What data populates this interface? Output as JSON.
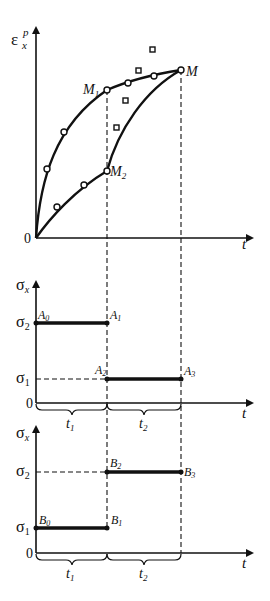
{
  "diagram": {
    "top_chart": {
      "y_axis_label": "ε",
      "y_axis_sup": "p",
      "y_axis_sub": "x",
      "x_axis_label": "t",
      "origin_label": "0",
      "points": {
        "M1": {
          "label": "M",
          "sub": "1"
        },
        "M": {
          "label": "M",
          "sub": ""
        },
        "M2": {
          "label": "M",
          "sub": "2"
        }
      }
    },
    "middle_chart": {
      "y_axis_label": "σ",
      "y_axis_sub": "x",
      "x_axis_label": "t",
      "origin_label": "0",
      "level_high": {
        "label": "σ",
        "sub": "2"
      },
      "level_low": {
        "label": "σ",
        "sub": "1"
      },
      "points": {
        "A0": {
          "label": "A",
          "sub": "0"
        },
        "A1": {
          "label": "A",
          "sub": "1"
        },
        "A2": {
          "label": "A",
          "sub": "2"
        },
        "A3": {
          "label": "A",
          "sub": "3"
        }
      },
      "intervals": [
        {
          "label": "t",
          "sub": "1"
        },
        {
          "label": "t",
          "sub": "2"
        }
      ]
    },
    "bottom_chart": {
      "y_axis_label": "σ",
      "y_axis_sub": "x",
      "x_axis_label": "t",
      "origin_label": "0",
      "level_high": {
        "label": "σ",
        "sub": "2"
      },
      "level_low": {
        "label": "σ",
        "sub": "1"
      },
      "points": {
        "B0": {
          "label": "B",
          "sub": "0"
        },
        "B1": {
          "label": "B",
          "sub": "1"
        },
        "B2": {
          "label": "B",
          "sub": "2"
        },
        "B3": {
          "label": "B",
          "sub": "3"
        }
      },
      "intervals": [
        {
          "label": "t",
          "sub": "1"
        },
        {
          "label": "t",
          "sub": "2"
        }
      ]
    }
  }
}
